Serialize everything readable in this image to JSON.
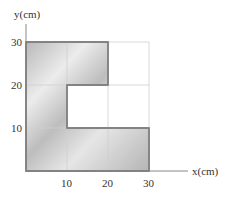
{
  "diagram": {
    "type": "L-shaped lamina on coordinate grid",
    "axes": {
      "x_label": "x(cm)",
      "y_label": "y(cm)",
      "x_ticks": [
        "10",
        "20",
        "30"
      ],
      "y_ticks": [
        "10",
        "20",
        "30"
      ]
    },
    "grid": {
      "spacing_cm": 10,
      "extent_cm": [
        0,
        30
      ]
    },
    "shape": {
      "description": "Shaded plate composed of unit squares",
      "vertices_cm": [
        [
          0,
          0
        ],
        [
          30,
          0
        ],
        [
          30,
          10
        ],
        [
          10,
          10
        ],
        [
          10,
          20
        ],
        [
          20,
          20
        ],
        [
          20,
          30
        ],
        [
          0,
          30
        ]
      ],
      "fill": "#c8c8c8",
      "stroke": "#777777"
    },
    "colors": {
      "grid": "#d0d0d0",
      "axis": "#888888",
      "text": "#333333"
    }
  }
}
